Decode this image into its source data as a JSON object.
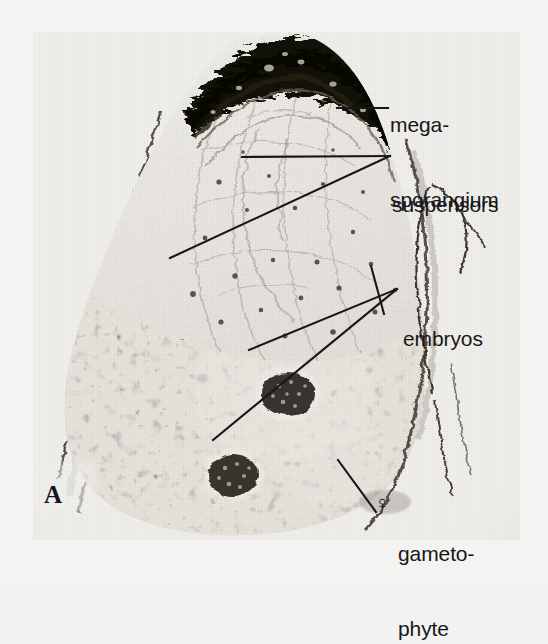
{
  "figure": {
    "panel_letter": "A",
    "plate": {
      "x": 33,
      "y": 32,
      "width": 487,
      "height": 508
    },
    "background_color": "#f3f3f2",
    "ink_color": "#17171a"
  },
  "labels": [
    {
      "name": "megasporangium",
      "lines": [
        "mega-",
        "sporangium"
      ],
      "x": 390,
      "y": 62,
      "leaders": [
        {
          "x1": 337,
          "y1": 108,
          "x2": 388,
          "y2": 108
        }
      ]
    },
    {
      "name": "suspensors",
      "lines": [
        "suspensors"
      ],
      "x": 392,
      "y": 142,
      "leaders": [
        {
          "x1": 242,
          "y1": 157,
          "x2": 390,
          "y2": 156
        },
        {
          "x1": 170,
          "y1": 258,
          "x2": 390,
          "y2": 156
        }
      ]
    },
    {
      "name": "embryos",
      "lines": [
        "embryos"
      ],
      "x": 403,
      "y": 276,
      "leaders": [
        {
          "x1": 249,
          "y1": 350,
          "x2": 397,
          "y2": 289
        },
        {
          "x1": 213,
          "y1": 440,
          "x2": 397,
          "y2": 289
        },
        {
          "x1": 370,
          "y1": 268,
          "x2": 383,
          "y2": 312
        }
      ]
    },
    {
      "name": "gametophyte",
      "symbol": "♀",
      "lines": [
        "gameto-",
        "phyte"
      ],
      "x": 398,
      "y": 503,
      "symbol_x": 377,
      "symbol_y": 503,
      "leaders": [
        {
          "x1": 338,
          "y1": 460,
          "x2": 376,
          "y2": 512
        }
      ]
    }
  ],
  "specimen": {
    "description_color_apex": "#15140f",
    "description_color_gametophyte": "#3a352f",
    "description_color_matrix": "#e6e3de"
  }
}
